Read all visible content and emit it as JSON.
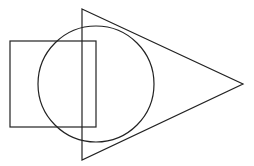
{
  "canvas": {
    "width": 254,
    "height": 166,
    "background": "#ffffff",
    "stroke_color": "#222222",
    "stroke_width": 1.2
  },
  "shapes": {
    "rectangle": {
      "x": 10,
      "y": 41,
      "width": 86,
      "height": 86
    },
    "circle": {
      "cx": 96,
      "cy": 84,
      "r": 58
    },
    "triangle": {
      "points": "82,9 243,84 82,160"
    }
  }
}
